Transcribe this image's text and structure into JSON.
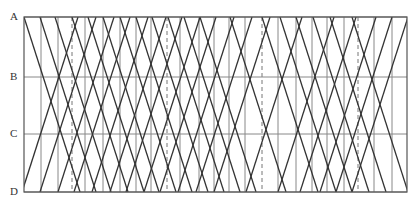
{
  "diagram": {
    "type": "train-graph",
    "frame": {
      "left": 24,
      "right": 407,
      "top": 17,
      "bottom": 192
    },
    "colors": {
      "frame": "#555555",
      "grid": "#888888",
      "train": "#333333",
      "dashed": "#777777"
    },
    "stations": [
      {
        "label": "A",
        "y": 17
      },
      {
        "label": "B",
        "y": 77
      },
      {
        "label": "C",
        "y": 134
      },
      {
        "label": "D",
        "y": 192
      }
    ],
    "vertical_lines": [
      {
        "x": 41,
        "dashed": false
      },
      {
        "x": 58,
        "dashed": false
      },
      {
        "x": 72,
        "dashed": true
      },
      {
        "x": 85,
        "dashed": false
      },
      {
        "x": 103,
        "dashed": false
      },
      {
        "x": 120,
        "dashed": false
      },
      {
        "x": 136,
        "dashed": false
      },
      {
        "x": 151,
        "dashed": false
      },
      {
        "x": 167,
        "dashed": true
      },
      {
        "x": 180,
        "dashed": false
      },
      {
        "x": 199,
        "dashed": false
      },
      {
        "x": 214,
        "dashed": false
      },
      {
        "x": 229,
        "dashed": false
      },
      {
        "x": 245,
        "dashed": false
      },
      {
        "x": 262,
        "dashed": true
      },
      {
        "x": 278,
        "dashed": false
      },
      {
        "x": 296,
        "dashed": false
      },
      {
        "x": 312,
        "dashed": false
      },
      {
        "x": 327,
        "dashed": false
      },
      {
        "x": 344,
        "dashed": false
      },
      {
        "x": 358,
        "dashed": true
      },
      {
        "x": 374,
        "dashed": false
      },
      {
        "x": 392,
        "dashed": false
      }
    ],
    "trains_down": [
      [
        24,
        80
      ],
      [
        40,
        96
      ],
      [
        55,
        111
      ],
      [
        72,
        128
      ],
      [
        88,
        144
      ],
      [
        103,
        159
      ],
      [
        120,
        176
      ],
      [
        136,
        192
      ],
      [
        152,
        208
      ],
      [
        168,
        224
      ],
      [
        184,
        240
      ],
      [
        200,
        256
      ],
      [
        230,
        286
      ],
      [
        262,
        318
      ],
      [
        280,
        336
      ],
      [
        296,
        352
      ],
      [
        313,
        369
      ],
      [
        330,
        386
      ],
      [
        352,
        408
      ]
    ],
    "trains_up": [
      [
        22,
        78
      ],
      [
        40,
        96
      ],
      [
        58,
        114
      ],
      [
        74,
        130
      ],
      [
        92,
        148
      ],
      [
        110,
        166
      ],
      [
        126,
        182
      ],
      [
        144,
        200
      ],
      [
        160,
        216
      ],
      [
        178,
        234
      ],
      [
        196,
        252
      ],
      [
        214,
        270
      ],
      [
        246,
        302
      ],
      [
        278,
        334
      ],
      [
        300,
        356
      ],
      [
        320,
        376
      ],
      [
        336,
        392
      ],
      [
        352,
        408
      ]
    ]
  }
}
